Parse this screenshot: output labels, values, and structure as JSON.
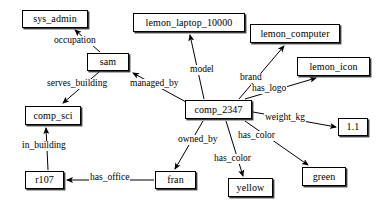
{
  "diagram": {
    "type": "directed-labeled-graph",
    "background_color": "#ffffff",
    "node_border_color": "#000000",
    "node_fill_color": "#ffffff",
    "edge_color": "#000000",
    "text_color": "#000000",
    "nodes": [
      {
        "id": "sys_admin",
        "label": "sys_admin",
        "x": 22,
        "y": 10,
        "w": 66,
        "h": 18
      },
      {
        "id": "lemon_laptop_10000",
        "label": "lemon_laptop_10000",
        "x": 133,
        "y": 13,
        "w": 112,
        "h": 19
      },
      {
        "id": "lemon_computer",
        "label": "lemon_computer",
        "x": 250,
        "y": 24,
        "w": 90,
        "h": 19
      },
      {
        "id": "lemon_icon",
        "label": "lemon_icon",
        "x": 297,
        "y": 57,
        "w": 73,
        "h": 19
      },
      {
        "id": "sam",
        "label": "sam",
        "x": 87,
        "y": 53,
        "w": 42,
        "h": 18
      },
      {
        "id": "comp_sci",
        "label": "comp_sci",
        "x": 25,
        "y": 106,
        "w": 56,
        "h": 19
      },
      {
        "id": "comp_2347",
        "label": "comp_2347",
        "x": 185,
        "y": 100,
        "w": 67,
        "h": 19
      },
      {
        "id": "weight_value",
        "label": "1.1",
        "x": 338,
        "y": 118,
        "w": 30,
        "h": 18
      },
      {
        "id": "r107",
        "label": "r107",
        "x": 25,
        "y": 171,
        "w": 39,
        "h": 18
      },
      {
        "id": "fran",
        "label": "fran",
        "x": 155,
        "y": 171,
        "w": 41,
        "h": 18
      },
      {
        "id": "yellow",
        "label": "yellow",
        "x": 228,
        "y": 178,
        "w": 45,
        "h": 19
      },
      {
        "id": "green",
        "label": "green",
        "x": 302,
        "y": 167,
        "w": 44,
        "h": 19
      }
    ],
    "edges": [
      {
        "id": "e_occupation",
        "from": "sam",
        "to": "sys_admin",
        "label": "occupation",
        "lx": 53,
        "ly": 36,
        "x1": 100,
        "y1": 52,
        "x2": 75,
        "y2": 30
      },
      {
        "id": "e_serves_building",
        "from": "sam",
        "to": "comp_sci",
        "label": "serves_building",
        "lx": 46,
        "ly": 79,
        "x1": 99,
        "y1": 72,
        "x2": 63,
        "y2": 103
      },
      {
        "id": "e_managed_by",
        "from": "comp_2347",
        "to": "sam",
        "label": "managed_by",
        "lx": 129,
        "ly": 79,
        "x1": 186,
        "y1": 102,
        "x2": 133,
        "y2": 73
      },
      {
        "id": "e_in_building",
        "from": "r107",
        "to": "comp_sci",
        "label": "in_building",
        "lx": 21,
        "ly": 141,
        "x1": 48,
        "y1": 170,
        "x2": 46,
        "y2": 128
      },
      {
        "id": "e_has_office",
        "from": "fran",
        "to": "r107",
        "label": "has_office",
        "lx": 89,
        "ly": 173,
        "x1": 154,
        "y1": 180,
        "x2": 67,
        "y2": 180
      },
      {
        "id": "e_model",
        "from": "comp_2347",
        "to": "lemon_laptop_10000",
        "label": "model",
        "lx": 189,
        "ly": 65,
        "x1": 204,
        "y1": 99,
        "x2": 190,
        "y2": 35
      },
      {
        "id": "e_brand",
        "from": "comp_2347",
        "to": "lemon_computer",
        "label": "brand",
        "lx": 239,
        "ly": 73,
        "x1": 239,
        "y1": 99,
        "x2": 284,
        "y2": 46
      },
      {
        "id": "e_has_logo",
        "from": "comp_2347",
        "to": "lemon_icon",
        "label": "has_logo",
        "lx": 251,
        "ly": 84,
        "x1": 245,
        "y1": 99,
        "x2": 316,
        "y2": 78
      },
      {
        "id": "e_weight_kg",
        "from": "comp_2347",
        "to": "weight_value",
        "label": "weight_kg",
        "lx": 264,
        "ly": 113,
        "x1": 253,
        "y1": 112,
        "x2": 336,
        "y2": 127
      },
      {
        "id": "e_owned_by",
        "from": "comp_2347",
        "to": "fran",
        "label": "owned_by",
        "lx": 177,
        "ly": 135,
        "x1": 203,
        "y1": 121,
        "x2": 175,
        "y2": 169
      },
      {
        "id": "e_has_color_y",
        "from": "comp_2347",
        "to": "yellow",
        "label": "has_color",
        "lx": 213,
        "ly": 154,
        "x1": 226,
        "y1": 121,
        "x2": 243,
        "y2": 176
      },
      {
        "id": "e_has_color_g",
        "from": "comp_2347",
        "to": "green",
        "label": "has_color",
        "lx": 237,
        "ly": 131,
        "x1": 245,
        "y1": 121,
        "x2": 308,
        "y2": 165
      }
    ]
  }
}
